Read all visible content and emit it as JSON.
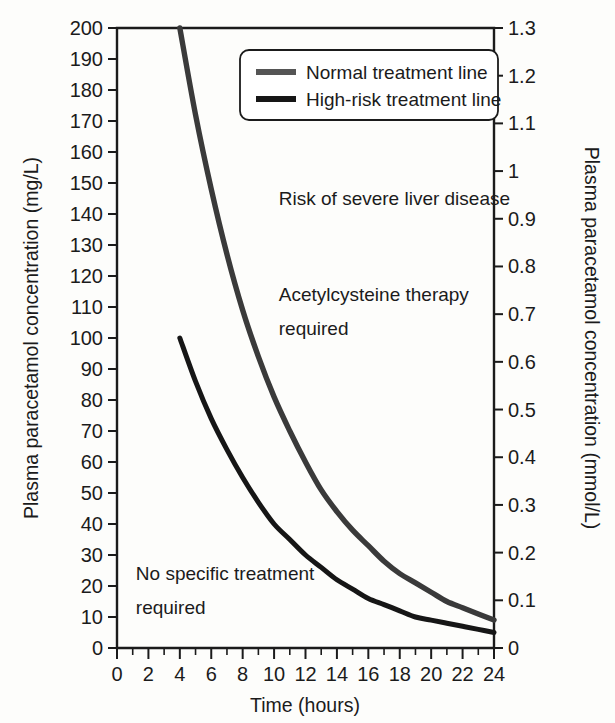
{
  "chart_data": {
    "type": "line",
    "title": "",
    "xlabel": "Time (hours)",
    "ylabel": "Plasma paracetamol concentration (mg/L)",
    "ylabel_right": "Plasma paracetamol concentration (mmol/L)",
    "xlim": [
      0,
      24
    ],
    "ylim": [
      0,
      200
    ],
    "ylim_right": [
      0,
      1.3
    ],
    "grid": false,
    "legend_position": "top-right",
    "xticks": [
      0,
      2,
      4,
      6,
      8,
      10,
      12,
      14,
      16,
      18,
      20,
      22,
      24
    ],
    "xticklabels": [
      "0",
      "2",
      "4",
      "6",
      "8",
      "10",
      "12",
      "14",
      "16",
      "18",
      "20",
      "22",
      "24"
    ],
    "xtick_minor_step": 1,
    "yticks": [
      0,
      10,
      20,
      30,
      40,
      50,
      60,
      70,
      80,
      90,
      100,
      110,
      120,
      130,
      140,
      150,
      160,
      170,
      180,
      190,
      200
    ],
    "yticklabels": [
      "0",
      "10",
      "20",
      "30",
      "40",
      "50",
      "60",
      "70",
      "80",
      "90",
      "100",
      "110",
      "120",
      "130",
      "140",
      "150",
      "160",
      "170",
      "180",
      "190",
      "200"
    ],
    "yticks_right": [
      0,
      0.1,
      0.2,
      0.3,
      0.4,
      0.5,
      0.6,
      0.7,
      0.8,
      0.9,
      1,
      1.1,
      1.2,
      1.3
    ],
    "yticklabels_right": [
      "0",
      "0.1",
      "0.2",
      "0.3",
      "0.4",
      "0.5",
      "0.6",
      "0.7",
      "0.8",
      "0.9",
      "1",
      "1.1",
      "1.2",
      "1.3"
    ],
    "series": [
      {
        "name": "Normal treatment line",
        "color": "#3a3a3a",
        "x": [
          4,
          5,
          6,
          7,
          8,
          9,
          10,
          11,
          12,
          13,
          14,
          15,
          16,
          17,
          18,
          19,
          20,
          21,
          22,
          23,
          24
        ],
        "values": [
          200,
          172,
          148,
          127,
          109,
          94,
          81,
          70,
          60,
          51,
          44,
          38,
          33,
          28,
          24,
          21,
          18,
          15,
          13,
          11,
          9
        ]
      },
      {
        "name": "High-risk treatment line",
        "color": "#161616",
        "x": [
          4,
          5,
          6,
          7,
          8,
          9,
          10,
          11,
          12,
          13,
          14,
          15,
          16,
          17,
          18,
          19,
          20,
          21,
          22,
          23,
          24
        ],
        "values": [
          100,
          86,
          74,
          64,
          55,
          47,
          40,
          35,
          30,
          26,
          22,
          19,
          16,
          14,
          12,
          10,
          9,
          8,
          7,
          6,
          5
        ]
      }
    ],
    "annotations": [
      {
        "text": "Risk of severe liver disease",
        "x": 10.3,
        "y": 143
      },
      {
        "text": "Acetylcysteine therapy",
        "x": 10.3,
        "y": 112
      },
      {
        "text": "required",
        "x": 10.3,
        "y": 101
      },
      {
        "text": "No specific treatment",
        "x": 1.2,
        "y": 22
      },
      {
        "text": "required",
        "x": 1.2,
        "y": 11
      }
    ]
  },
  "legend": {
    "items": [
      {
        "label": "Normal treatment line"
      },
      {
        "label": "High-risk treatment line"
      }
    ]
  },
  "axes": {
    "left_title": "Plasma paracetamol concentration (mg/L)",
    "right_title": "Plasma paracetamol concentration (mmol/L)",
    "bottom_title": "Time (hours)"
  }
}
